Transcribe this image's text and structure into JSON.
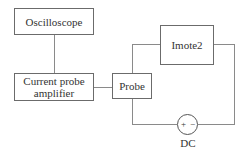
{
  "diagram": {
    "nodes": {
      "oscilloscope": {
        "label": "Oscilloscope"
      },
      "amplifier": {
        "label_line1": "Current probe",
        "label_line2": "amplifier"
      },
      "probe": {
        "label": "Probe"
      },
      "imote2": {
        "label": "Imote2"
      },
      "dc_source": {
        "label": "DC",
        "plus": "+",
        "minus": "−"
      }
    },
    "edges": [
      {
        "from": "oscilloscope",
        "to": "amplifier"
      },
      {
        "from": "amplifier",
        "to": "probe"
      },
      {
        "from": "probe",
        "to": "imote2"
      },
      {
        "from": "imote2",
        "to": "dc_source"
      },
      {
        "from": "dc_source",
        "to": "probe"
      }
    ]
  }
}
